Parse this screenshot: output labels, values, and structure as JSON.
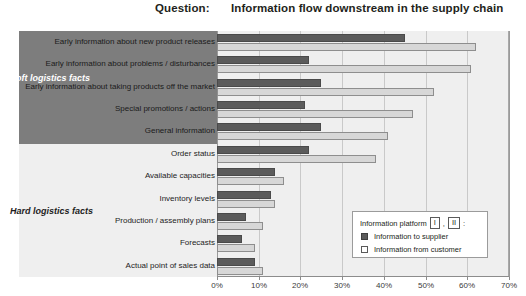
{
  "header": {
    "question_label": "Question:",
    "title": "Information flow downstream in the supply chain"
  },
  "groups": [
    {
      "name": "Soft logistics facts",
      "count": 5
    },
    {
      "name": "Hard logistics facts",
      "count": 7
    }
  ],
  "legend": {
    "title_prefix": "Information platform",
    "platform_1": "I",
    "separator": ",",
    "platform_2": "II",
    "suffix": ":",
    "entries": [
      {
        "label": "Information to supplier",
        "color": "#5b5b5b",
        "style": "filled"
      },
      {
        "label": "Information from customer",
        "color": "#ffffff",
        "style": "outline"
      }
    ]
  },
  "axis": {
    "ticks": [
      "0%",
      "10%",
      "20%",
      "30%",
      "40%",
      "50%",
      "60%",
      "70%"
    ],
    "min": 0,
    "max": 70
  },
  "chart_data": {
    "type": "bar",
    "orientation": "horizontal",
    "title": "Information flow downstream in the supply chain",
    "xlabel": "",
    "ylabel": "",
    "xlim": [
      0,
      70
    ],
    "grid": true,
    "legend_position": "bottom-right",
    "categories": [
      "Early information about new product releases",
      "Early information about problems / disturbances",
      "Early information about taking products off the market",
      "Special promotions / actions",
      "General information",
      "Order status",
      "Available capacities",
      "Inventory levels",
      "Production / assembly plans",
      "Forecasts",
      "Actual point of sales data"
    ],
    "series": [
      {
        "name": "Information to supplier",
        "color": "#5b5b5b",
        "values": [
          45,
          22,
          25,
          21,
          25,
          22,
          14,
          13,
          7,
          6,
          9
        ]
      },
      {
        "name": "Information from customer",
        "color": "#d7d7d7",
        "values": [
          62,
          61,
          52,
          47,
          41,
          38,
          16,
          14,
          11,
          9,
          11
        ]
      }
    ],
    "group_assignment": [
      "Soft logistics facts",
      "Soft logistics facts",
      "Soft logistics facts",
      "Soft logistics facts",
      "Soft logistics facts",
      "Hard logistics facts",
      "Hard logistics facts",
      "Hard logistics facts",
      "Hard logistics facts",
      "Hard logistics facts",
      "Hard logistics facts"
    ]
  }
}
